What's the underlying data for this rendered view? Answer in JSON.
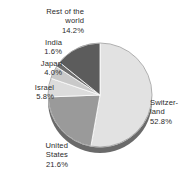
{
  "chart_data": {
    "type": "pie",
    "title": "",
    "subtitle": "",
    "xlabel": "",
    "ylabel": "",
    "legend_position": "none",
    "grid": false,
    "start_angle_deg": 0,
    "direction": "clockwise",
    "units": "percent",
    "categories": [
      "Switzerland",
      "United States",
      "Israel",
      "Japan",
      "India",
      "Rest of the world"
    ],
    "values": [
      52.8,
      21.6,
      5.8,
      4.0,
      1.6,
      14.2
    ],
    "slices": [
      {
        "name": "Switzerland",
        "label_text": "Switzer-\nland\n52.8%",
        "value": 52.8,
        "value_text": "52.8%",
        "color": "#e2e2e2"
      },
      {
        "name": "United States",
        "label_text": "United\nStates\n21.6%",
        "value": 21.6,
        "value_text": "21.6%",
        "color": "#9a9a9a"
      },
      {
        "name": "Israel",
        "label_text": "Israel\n5.8%",
        "value": 5.8,
        "value_text": "5.8%",
        "color": "#dcdcdc"
      },
      {
        "name": "Japan",
        "label_text": "Japan\n4.0%",
        "value": 4.0,
        "value_text": "4.0%",
        "color": "#c9c9c9"
      },
      {
        "name": "India",
        "label_text": "India\n1.6%",
        "value": 1.6,
        "value_text": "1.6%",
        "color": "#6e6e6e"
      },
      {
        "name": "Rest of the world",
        "label_text": "Rest of the\nworld\n14.2%",
        "value": 14.2,
        "value_text": "14.2%",
        "color": "#5c5c5c"
      }
    ],
    "geometry": {
      "center_x": 100,
      "center_y": 95,
      "radius": 52,
      "depth": 6
    },
    "colors": {
      "background": "#ffffff",
      "label_text": "#2b2b2b",
      "slice_outline": "#ffffff",
      "rim_shadow": "#6a6a6a"
    }
  }
}
